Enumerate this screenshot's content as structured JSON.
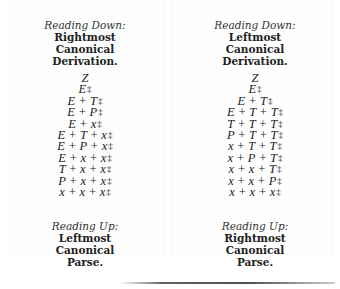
{
  "left_column": {
    "top_caption": {
      "direction": "Reading Down:",
      "line1": "Rightmost",
      "line2": "Canonical",
      "line3": "Derivation."
    },
    "steps": [
      "Z",
      "E‡",
      "E + T‡",
      "E + P‡",
      "E + x‡",
      "E + T + x‡",
      "E + P + x‡",
      "E + x + x‡",
      "T + x + x‡",
      "P + x + x‡",
      "x + x + x‡"
    ],
    "bottom_caption": {
      "direction": "Reading Up:",
      "line1": "Leftmost",
      "line2": "Canonical",
      "line3": "Parse."
    }
  },
  "right_column": {
    "top_caption": {
      "direction": "Reading Down:",
      "line1": "Leftmost",
      "line2": "Canonical",
      "line3": "Derivation."
    },
    "steps": [
      "Z",
      "E‡",
      "E + T‡",
      "E + T + T‡",
      "T + T + T‡",
      "P + T + T‡",
      "x + T + T‡",
      "x + P + T‡",
      "x + x + T‡",
      "x + x + P‡",
      "x + x + x‡"
    ],
    "bottom_caption": {
      "direction": "Reading Up:",
      "line1": "Rightmost",
      "line2": "Canonical",
      "line3": "Parse."
    }
  },
  "end_marker_symbol": "‡"
}
